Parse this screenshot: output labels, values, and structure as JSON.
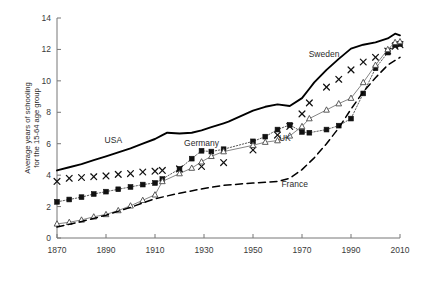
{
  "chart_data": {
    "type": "line",
    "title": "",
    "subtitle": "",
    "xlabel": "",
    "ylabel": "Average years of schooling for the 15-64 age group",
    "ylabel_line1": "Average years of schooling",
    "ylabel_line2": "for the 15-64 age group",
    "xlim": [
      1870,
      2010
    ],
    "ylim": [
      0,
      14
    ],
    "xticks": [
      1870,
      1890,
      1910,
      1930,
      1950,
      1970,
      1990,
      2010
    ],
    "xticklabels": [
      "1870",
      "1890",
      "1910",
      "1930",
      "1950",
      "1970",
      "1990",
      "2010"
    ],
    "yticks": [
      0,
      2,
      4,
      6,
      8,
      10,
      12,
      14
    ],
    "yticklabels": [
      "0",
      "2",
      "4",
      "6",
      "8",
      "10",
      "12",
      "14"
    ],
    "grid": false,
    "legend_position": "inline-annotations",
    "annotations": [
      {
        "text": "USA",
        "x": 1893,
        "y": 6.05
      },
      {
        "text": "Germany",
        "x": 1929,
        "y": 5.85
      },
      {
        "text": "UK",
        "x": 1963,
        "y": 6.15
      },
      {
        "text": "France",
        "x": 1967,
        "y": 3.25
      },
      {
        "text": "Sweden",
        "x": 1979,
        "y": 11.55
      }
    ],
    "series": [
      {
        "name": "USA",
        "marker": "none",
        "linestyle": "solid",
        "color": "#000000",
        "x": [
          1870,
          1875,
          1880,
          1885,
          1890,
          1895,
          1900,
          1905,
          1910,
          1913,
          1915,
          1920,
          1925,
          1929,
          1933,
          1938,
          1940,
          1945,
          1950,
          1955,
          1960,
          1965,
          1970,
          1973,
          1975,
          1980,
          1985,
          1990,
          1995,
          2000,
          2005,
          2008,
          2010
        ],
        "y": [
          4.3,
          4.5,
          4.7,
          4.95,
          5.2,
          5.45,
          5.7,
          6.0,
          6.3,
          6.55,
          6.7,
          6.65,
          6.7,
          6.85,
          7.05,
          7.3,
          7.4,
          7.75,
          8.1,
          8.35,
          8.5,
          8.4,
          8.9,
          9.5,
          9.9,
          10.7,
          11.4,
          12.05,
          12.3,
          12.45,
          12.7,
          13.0,
          12.9
        ]
      },
      {
        "name": "Sweden",
        "marker": "x",
        "linestyle": "none",
        "color": "#1a1a1a",
        "x": [
          1870,
          1875,
          1880,
          1885,
          1890,
          1895,
          1900,
          1905,
          1910,
          1913,
          1920,
          1929,
          1938,
          1950,
          1960,
          1965,
          1970,
          1973,
          1980,
          1985,
          1990,
          1995,
          2000,
          2005,
          2008,
          2010
        ],
        "y": [
          3.6,
          3.8,
          3.85,
          3.9,
          3.95,
          4.05,
          4.1,
          4.2,
          4.25,
          4.3,
          4.4,
          4.55,
          4.8,
          5.6,
          6.55,
          7.1,
          7.9,
          8.6,
          9.6,
          10.1,
          10.7,
          11.2,
          11.5,
          11.9,
          12.2,
          12.3
        ]
      },
      {
        "name": "Germany",
        "marker": "filled-square",
        "linestyle": "dotted",
        "color": "#111111",
        "x": [
          1870,
          1875,
          1880,
          1885,
          1890,
          1895,
          1900,
          1905,
          1910,
          1913,
          1920,
          1925,
          1929,
          1933,
          1938,
          1950,
          1955,
          1960,
          1965,
          1970,
          1973,
          1980,
          1985,
          1990,
          1995,
          2000,
          2005,
          2008,
          2010
        ],
        "y": [
          2.3,
          2.45,
          2.6,
          2.8,
          2.95,
          3.1,
          3.25,
          3.4,
          3.5,
          3.75,
          4.4,
          5.05,
          5.55,
          5.5,
          5.65,
          6.15,
          6.45,
          6.9,
          7.2,
          6.75,
          6.7,
          6.9,
          7.15,
          7.6,
          9.2,
          10.8,
          11.8,
          12.3,
          12.35
        ]
      },
      {
        "name": "UK",
        "marker": "open-triangle",
        "linestyle": "solid-thin",
        "color": "#555555",
        "x": [
          1870,
          1875,
          1880,
          1885,
          1890,
          1895,
          1900,
          1905,
          1910,
          1913,
          1920,
          1925,
          1929,
          1933,
          1938,
          1950,
          1955,
          1960,
          1965,
          1970,
          1973,
          1980,
          1985,
          1990,
          1995,
          2000,
          2005,
          2008,
          2010
        ],
        "y": [
          0.9,
          1.0,
          1.15,
          1.35,
          1.5,
          1.75,
          2.05,
          2.4,
          2.75,
          3.6,
          4.1,
          4.45,
          4.85,
          5.2,
          5.5,
          5.9,
          6.1,
          6.2,
          6.5,
          7.1,
          7.6,
          8.15,
          8.55,
          8.9,
          9.9,
          11.0,
          12.0,
          12.45,
          12.5
        ]
      },
      {
        "name": "France",
        "marker": "none",
        "linestyle": "dashed",
        "color": "#000000",
        "x": [
          1870,
          1880,
          1890,
          1900,
          1910,
          1920,
          1930,
          1938,
          1950,
          1955,
          1960,
          1965,
          1970,
          1975,
          1980,
          1985,
          1990,
          1995,
          2000,
          2005,
          2010
        ],
        "y": [
          0.7,
          1.05,
          1.45,
          1.95,
          2.5,
          2.85,
          3.15,
          3.35,
          3.5,
          3.55,
          3.6,
          3.8,
          4.35,
          5.1,
          6.0,
          7.0,
          8.2,
          9.3,
          10.2,
          11.0,
          11.5
        ]
      }
    ]
  }
}
